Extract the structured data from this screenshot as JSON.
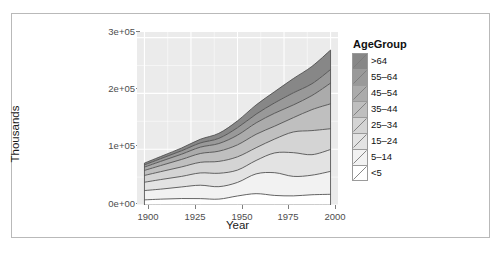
{
  "chart_data": {
    "type": "area",
    "title": "",
    "subtitle": "",
    "xlabel": "Year",
    "ylabel": "Thousands",
    "xlim": [
      1896,
      2004
    ],
    "ylim": [
      0,
      310000
    ],
    "xticks": [
      1900,
      1925,
      1950,
      1975,
      2000
    ],
    "xtick_labels": [
      "1900",
      "1925",
      "1950",
      "1975",
      "2000"
    ],
    "yticks": [
      0,
      100000,
      200000,
      300000
    ],
    "ytick_labels": [
      "0e+00",
      "1e+05",
      "2e+05",
      "3e+05"
    ],
    "grid": true,
    "grid_color": "#ffffff",
    "panel_background": "#ebebeb",
    "stacked": true,
    "legend": {
      "title": "AgeGroup",
      "position": "right",
      "order_top_to_bottom": [
        ">64",
        "55–64",
        "45–54",
        "35–44",
        "25–34",
        "15–24",
        "5–14",
        "<5"
      ]
    },
    "x": [
      1900,
      1910,
      1920,
      1930,
      1940,
      1950,
      1960,
      1970,
      1980,
      1990,
      2000
    ],
    "series": [
      {
        "name": "<5",
        "fill": "#ffffff",
        "values": [
          9171,
          10632,
          11573,
          11444,
          10541,
          16163,
          20321,
          17148,
          16348,
          18354,
          19176
        ]
      },
      {
        "name": "5–14",
        "fill": "#f2f2f2",
        "values": [
          16700,
          18200,
          20800,
          24000,
          22300,
          24319,
          35465,
          40746,
          34942,
          35095,
          41078
        ]
      },
      {
        "name": "15–24",
        "fill": "#e3e3e3",
        "values": [
          14951,
          17400,
          18900,
          22000,
          24000,
          22098,
          24020,
          35441,
          42487,
          36715,
          39184
        ]
      },
      {
        "name": "25–34",
        "fill": "#d4d4d4",
        "values": [
          12162,
          14500,
          17000,
          19000,
          21300,
          23759,
          22818,
          24907,
          37082,
          43176,
          37233
        ]
      },
      {
        "name": "35–44",
        "fill": "#bfbfbf",
        "values": [
          9000,
          11200,
          13400,
          15800,
          18300,
          21450,
          24081,
          23088,
          25634,
          37579,
          44659
        ]
      },
      {
        "name": "45–54",
        "fill": "#ababab",
        "values": [
          6000,
          7700,
          9400,
          11400,
          13700,
          17343,
          20485,
          23220,
          22800,
          25223,
          37030
        ]
      },
      {
        "name": "55–64",
        "fill": "#999999",
        "values": [
          4000,
          5000,
          6200,
          7500,
          9300,
          13370,
          15572,
          18590,
          21703,
          21148,
          24275
        ]
      },
      {
        "name": ">64",
        "fill": "#878787",
        "values": [
          3100,
          3950,
          4930,
          6630,
          9020,
          12270,
          16560,
          20107,
          25550,
          31080,
          34991
        ]
      }
    ],
    "totals": [
      75085,
      88582,
      102203,
      117774,
      128461,
      150772,
      179322,
      203247,
      226546,
      248370,
      277626
    ]
  },
  "legend": {
    "title": "AgeGroup",
    "rows": [
      {
        "label": ">64",
        "color": "#878787"
      },
      {
        "label": "55–64",
        "color": "#999999"
      },
      {
        "label": "45–54",
        "color": "#ababab"
      },
      {
        "label": "35–44",
        "color": "#bfbfbf"
      },
      {
        "label": "25–34",
        "color": "#d4d4d4"
      },
      {
        "label": "15–24",
        "color": "#e3e3e3"
      },
      {
        "label": "5–14",
        "color": "#f2f2f2"
      },
      {
        "label": "<5",
        "color": "#ffffff"
      }
    ]
  },
  "axes": {
    "x_title": "Year",
    "y_title": "Thousands",
    "x_tick_labels": [
      "1900",
      "1925",
      "1950",
      "1975",
      "2000"
    ],
    "y_tick_labels": [
      "3e+05",
      "2e+05",
      "1e+05",
      "0e+00"
    ]
  }
}
